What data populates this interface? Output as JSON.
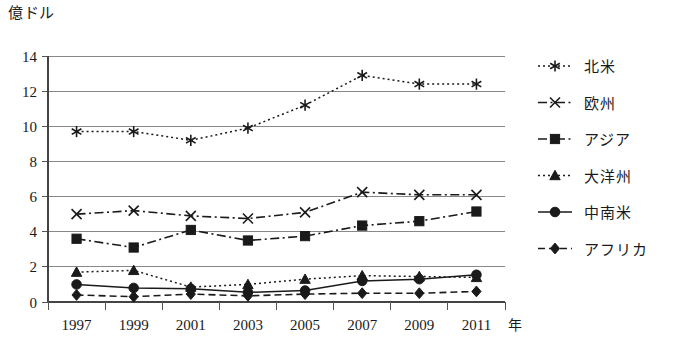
{
  "chart_data": {
    "type": "line",
    "title": "",
    "ylabel": "億ドル",
    "xlabel": "年",
    "x_unit_suffix": "年",
    "categories": [
      "1997",
      "1999",
      "2001",
      "2003",
      "2005",
      "2007",
      "2009",
      "2011"
    ],
    "ylim": [
      0,
      14
    ],
    "ytick_step": 2,
    "yticks": [
      "0",
      "2",
      "4",
      "6",
      "8",
      "10",
      "12",
      "14"
    ],
    "grid": "horizontal",
    "legend_position": "right",
    "series": [
      {
        "name": "北米",
        "marker": "asterisk",
        "linestyle": "dotted",
        "color": "#1a1a1a",
        "values": [
          9.7,
          9.7,
          9.2,
          9.9,
          11.2,
          12.9,
          12.4,
          12.4
        ]
      },
      {
        "name": "欧州",
        "marker": "x-cross",
        "linestyle": "dash-dot",
        "color": "#1a1a1a",
        "values": [
          5.0,
          5.2,
          4.9,
          4.75,
          5.1,
          6.25,
          6.1,
          6.1
        ]
      },
      {
        "name": "アジア",
        "marker": "square",
        "linestyle": "dash-dot",
        "color": "#1a1a1a",
        "values": [
          3.6,
          3.1,
          4.1,
          3.5,
          3.75,
          4.35,
          4.6,
          5.15
        ]
      },
      {
        "name": "大洋州",
        "marker": "triangle",
        "linestyle": "dotted",
        "color": "#1a1a1a",
        "values": [
          1.7,
          1.8,
          0.85,
          1.0,
          1.3,
          1.5,
          1.45,
          1.4
        ]
      },
      {
        "name": "中南米",
        "marker": "circle",
        "linestyle": "solid",
        "color": "#1a1a1a",
        "values": [
          1.0,
          0.8,
          0.75,
          0.55,
          0.65,
          1.2,
          1.3,
          1.55
        ]
      },
      {
        "name": "アフリカ",
        "marker": "diamond",
        "linestyle": "dashed",
        "color": "#1a1a1a",
        "values": [
          0.4,
          0.3,
          0.45,
          0.35,
          0.45,
          0.5,
          0.5,
          0.6
        ]
      }
    ]
  },
  "legend": {
    "items": [
      {
        "label": "北米"
      },
      {
        "label": "欧州"
      },
      {
        "label": "アジア"
      },
      {
        "label": "大洋州"
      },
      {
        "label": "中南米"
      },
      {
        "label": "アフリカ"
      }
    ]
  }
}
